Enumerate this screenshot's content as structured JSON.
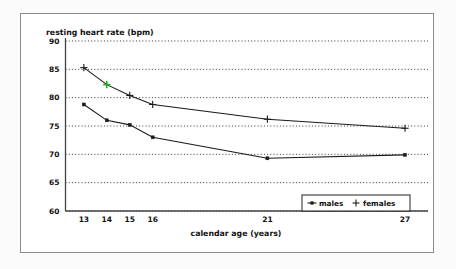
{
  "figure": {
    "background_color": "#fbfbfb",
    "plot_background_color": "#ffffff",
    "border_color": "#8a8a8a"
  },
  "chart_data": {
    "type": "line",
    "title": "",
    "ylabel": "resting heart rate (bpm)",
    "xlabel": "calendar age (years)",
    "x": [
      13,
      14,
      15,
      16,
      21,
      27
    ],
    "xtick_labels": [
      "13",
      "14",
      "15",
      "16",
      "21",
      "27"
    ],
    "ytick_labels": [
      "90",
      "85",
      "80",
      "75",
      "70",
      "65",
      "60"
    ],
    "ytick_values": [
      90,
      85,
      80,
      75,
      70,
      65,
      60
    ],
    "ylim": [
      60,
      90
    ],
    "xlim": [
      12.2,
      28.0
    ],
    "grid": "horizontal-dotted",
    "legend_position": "bottom-right",
    "series": [
      {
        "name": "males",
        "marker": "square-dot",
        "color": "#1a1a1a",
        "values": [
          78.8,
          76.0,
          75.2,
          73.0,
          69.3,
          69.9
        ]
      },
      {
        "name": "females",
        "marker": "plus",
        "color": "#1a1a1a",
        "highlight_color": "#22aa22",
        "highlighted_index": 1,
        "values": [
          85.3,
          82.3,
          80.4,
          78.8,
          76.2,
          74.6
        ]
      }
    ]
  },
  "legend": {
    "items": [
      {
        "label": "males",
        "marker": "square-dot"
      },
      {
        "label": "females",
        "marker": "plus"
      }
    ]
  }
}
